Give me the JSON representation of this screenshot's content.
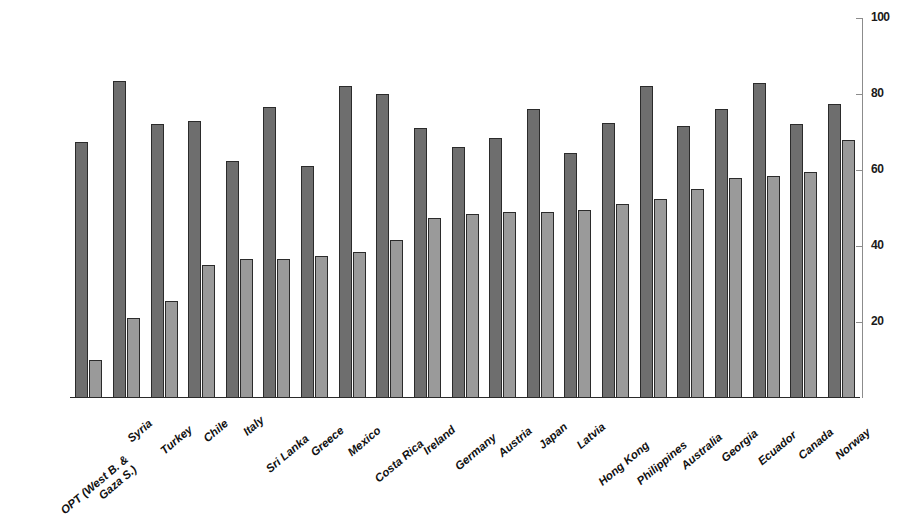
{
  "chart_data": {
    "type": "bar",
    "title": "",
    "subtitle": "",
    "xlabel": "",
    "ylabel": "",
    "ylim": [
      0,
      100
    ],
    "grid": false,
    "legend_position": "none",
    "y_ticks": [
      20,
      40,
      60,
      80,
      100
    ],
    "y_tick_labels": [
      "20",
      "40",
      "60",
      "80",
      "100"
    ],
    "categories": [
      "OPT (West B. & Gaza S.)",
      "Syria",
      "Turkey",
      "Chile",
      "Italy",
      "Sri Lanka",
      "Greece",
      "Mexico",
      "Costa Rica",
      "Ireland",
      "Germany",
      "Austria",
      "Japan",
      "Latvia",
      "Hong Kong",
      "Philippines",
      "Australia",
      "Georgia",
      "Ecuador",
      "Canada",
      "Norway"
    ],
    "category_lines": [
      [
        "OPT (West B. &",
        "Gaza S.)"
      ],
      [
        "Syria"
      ],
      [
        "Turkey"
      ],
      [
        "Chile"
      ],
      [
        "Italy"
      ],
      [
        "Sri Lanka"
      ],
      [
        "Greece"
      ],
      [
        "Mexico"
      ],
      [
        "Costa Rica"
      ],
      [
        "Ireland"
      ],
      [
        "Germany"
      ],
      [
        "Austria"
      ],
      [
        "Japan"
      ],
      [
        "Latvia"
      ],
      [
        "Hong Kong"
      ],
      [
        "Philippines"
      ],
      [
        "Australia"
      ],
      [
        "Georgia"
      ],
      [
        "Ecuador"
      ],
      [
        "Canada"
      ],
      [
        "Norway"
      ]
    ],
    "series": [
      {
        "name": "Series 1",
        "color": "#6e6e6e",
        "values": [
          67.5,
          83.5,
          72.0,
          73.0,
          62.5,
          76.5,
          61.0,
          82.0,
          80.0,
          71.0,
          66.0,
          68.5,
          76.0,
          64.5,
          72.5,
          82.0,
          71.5,
          76.0,
          83.0,
          72.0,
          77.5
        ]
      },
      {
        "name": "Series 2",
        "color": "#9a9a9a",
        "values": [
          10.0,
          21.0,
          25.5,
          35.0,
          36.5,
          36.5,
          37.5,
          38.5,
          41.5,
          47.5,
          48.5,
          49.0,
          49.0,
          49.5,
          51.0,
          52.5,
          55.0,
          58.0,
          58.5,
          59.5,
          68.0
        ]
      }
    ]
  },
  "style": {
    "bar_border_color": "#2b2b2b",
    "axis_color": "#8c8c8c",
    "baseline_color": "#2a2a2a",
    "background": "#ffffff"
  }
}
